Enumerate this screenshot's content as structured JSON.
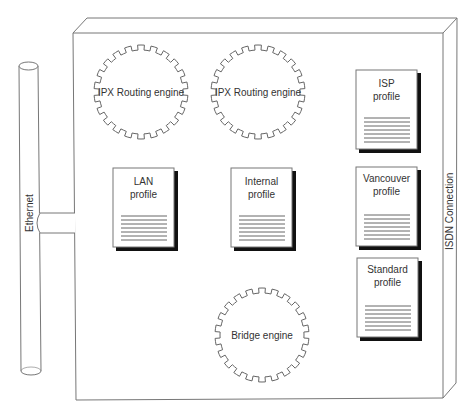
{
  "diagram": {
    "colors": {
      "stroke": "#777777",
      "text": "#333333",
      "shadow": "#111111",
      "background": "#ffffff"
    },
    "ethernet": {
      "label": "Ethernet"
    },
    "chassis": {
      "side_label": "ISDN Connection"
    },
    "engines": [
      {
        "label": "IPX Routing engine"
      },
      {
        "label": "IPX Routing engine"
      },
      {
        "label": "Bridge engine"
      }
    ],
    "profiles": [
      {
        "line1": "ISP",
        "line2": "profile"
      },
      {
        "line1": "LAN",
        "line2": "profile"
      },
      {
        "line1": "Internal",
        "line2": "profile"
      },
      {
        "line1": "Vancouver",
        "line2": "profile"
      },
      {
        "line1": "Standard",
        "line2": "profile"
      }
    ]
  }
}
